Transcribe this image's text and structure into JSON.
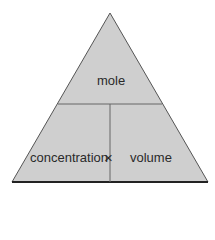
{
  "diagram": {
    "type": "formula-triangle",
    "top": "mole",
    "bottom_left": "concentration",
    "operator": "×",
    "bottom_right": "volume",
    "fill_color": "#cfcfcf",
    "line_color": "#555555",
    "outline_color": "#222222"
  }
}
